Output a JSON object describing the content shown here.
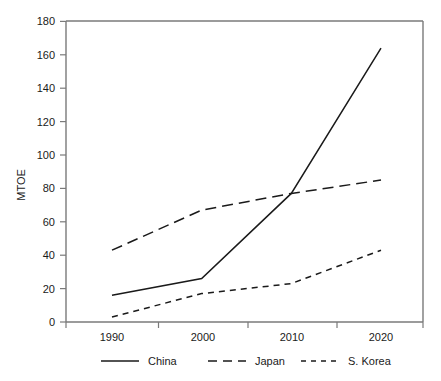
{
  "chart_data": {
    "type": "line",
    "title": "",
    "xlabel": "",
    "ylabel": "MTOE",
    "x": [
      1990,
      2000,
      2010,
      2020
    ],
    "categories": [
      "1990",
      "2000",
      "2010",
      "2020"
    ],
    "xticklabels": [
      "1990",
      "2000",
      "2010",
      "2020"
    ],
    "yticklabels": [
      "0",
      "20",
      "40",
      "60",
      "80",
      "100",
      "120",
      "140",
      "160",
      "180"
    ],
    "yticks": [
      0,
      20,
      40,
      60,
      80,
      100,
      120,
      140,
      160,
      180
    ],
    "ylim": [
      0,
      180
    ],
    "xlim": [
      1985,
      2025
    ],
    "grid": false,
    "legend_position": "bottom",
    "series": [
      {
        "name": "China",
        "style": "solid",
        "color": "#1a1a1a",
        "values": [
          16,
          26,
          77,
          164
        ]
      },
      {
        "name": "Japan",
        "style": "long-dash",
        "color": "#1a1a1a",
        "values": [
          43,
          67,
          77,
          85
        ]
      },
      {
        "name": "S. Korea",
        "style": "short-dash",
        "color": "#1a1a1a",
        "values": [
          3,
          17,
          23,
          43
        ]
      }
    ]
  },
  "axes": {
    "y_title": "MTOE",
    "y_tick_0": "0",
    "y_tick_1": "20",
    "y_tick_2": "40",
    "y_tick_3": "60",
    "y_tick_4": "80",
    "y_tick_5": "100",
    "y_tick_6": "120",
    "y_tick_7": "140",
    "y_tick_8": "160",
    "y_tick_9": "180",
    "x_tick_0": "1990",
    "x_tick_1": "2000",
    "x_tick_2": "2010",
    "x_tick_3": "2020"
  },
  "legend": {
    "entry_0": "China",
    "entry_1": "Japan",
    "entry_2": "S. Korea"
  }
}
